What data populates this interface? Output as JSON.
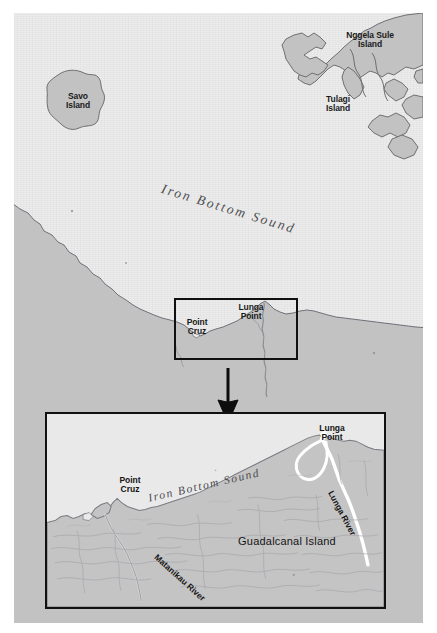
{
  "map": {
    "title": "Guadalcanal and Iron Bottom Sound",
    "colors": {
      "sea": "#ececec",
      "land": "#c2c2c2",
      "coastline": "#6f6f74",
      "label_text": "#1a1a1a",
      "water_label": "#4e4e52",
      "inset_border": "#101010",
      "arrow": "#0d0d0d",
      "river": "#ffffff",
      "contour": "#a8a8ae"
    },
    "overview": {
      "water_body": "Iron Bottom Sound",
      "islands": [
        {
          "name": "Savo\nIsland",
          "id": "savo-island"
        },
        {
          "name": "Nggela Sule\nIsland",
          "id": "nggela-sule-island"
        },
        {
          "name": "Tulagi\nIsland",
          "id": "tulagi-island"
        }
      ],
      "points": [
        {
          "name": "Point\nCruz",
          "id": "point-cruz"
        },
        {
          "name": "Lunga\nPoint",
          "id": "lunga-point"
        }
      ],
      "inset_marker": "detail area rectangle"
    },
    "detail": {
      "water_body": "Iron Bottom Sound",
      "island": "Guadalcanal Island",
      "points": [
        {
          "name": "Point\nCruz",
          "id": "point-cruz"
        },
        {
          "name": "Lunga\nPoint",
          "id": "lunga-point"
        }
      ],
      "rivers": [
        {
          "name": "Matanikau River",
          "id": "matanikau-river"
        },
        {
          "name": "Lunga River",
          "id": "lunga-river"
        }
      ]
    }
  }
}
